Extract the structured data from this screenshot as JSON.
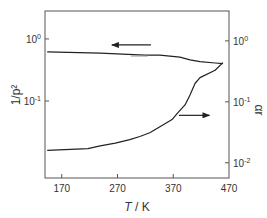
{
  "chart_data": {
    "type": "line",
    "title": "",
    "xlabel": "T / K",
    "xlabel_italic_part": "T",
    "xlabel_rest": " / K",
    "ylabel_left": "1/p²",
    "ylabel_right": "αr",
    "xlim": [
      140,
      470
    ],
    "ylim_left_log10": [
      -2.24,
      0.45
    ],
    "ylim_right_log10": [
      -2.25,
      0.49
    ],
    "yscale": "log",
    "grid": false,
    "x_ticks": [
      170,
      270,
      370,
      470
    ],
    "x_tick_labels": [
      "170",
      "270",
      "370",
      "470"
    ],
    "y_ticks_left": [
      {
        "value": 1,
        "base": "10",
        "exp": "0"
      },
      {
        "value": 0.1,
        "base": "10",
        "exp": "-1"
      }
    ],
    "y_ticks_right": [
      {
        "value": 1,
        "base": "10",
        "exp": "0"
      },
      {
        "value": 0.1,
        "base": "10",
        "exp": "-1"
      },
      {
        "value": 0.01,
        "base": "10",
        "exp": "-2"
      }
    ],
    "series": [
      {
        "name": "1/p²",
        "axis": "left",
        "arrow": "left",
        "x": [
          144,
          239,
          319,
          346,
          382,
          400,
          418,
          445,
          459
        ],
        "y": [
          0.62,
          0.59,
          0.55,
          0.55,
          0.51,
          0.46,
          0.43,
          0.41,
          0.4
        ]
      },
      {
        "name": "αr",
        "axis": "right",
        "arrow": "right",
        "x": [
          144,
          217,
          239,
          266,
          292,
          310,
          328,
          346,
          368,
          378,
          391,
          400,
          409,
          418,
          445,
          459
        ],
        "y": [
          0.016,
          0.017,
          0.019,
          0.021,
          0.024,
          0.027,
          0.031,
          0.039,
          0.051,
          0.066,
          0.089,
          0.13,
          0.2,
          0.25,
          0.33,
          0.44
        ]
      }
    ],
    "annotations": [
      {
        "type": "arrow",
        "direction": "left",
        "series": "1/p²",
        "x_from": 330,
        "x_to": 260,
        "y": 0.8,
        "axis": "left"
      },
      {
        "type": "arrow",
        "direction": "right",
        "series": "αr",
        "x_from": 380,
        "x_to": 435,
        "y": 0.06,
        "axis": "right"
      },
      {
        "type": "gray-segment",
        "x_from": 294,
        "x_to": 324,
        "y": 0.53,
        "axis": "left"
      }
    ]
  }
}
